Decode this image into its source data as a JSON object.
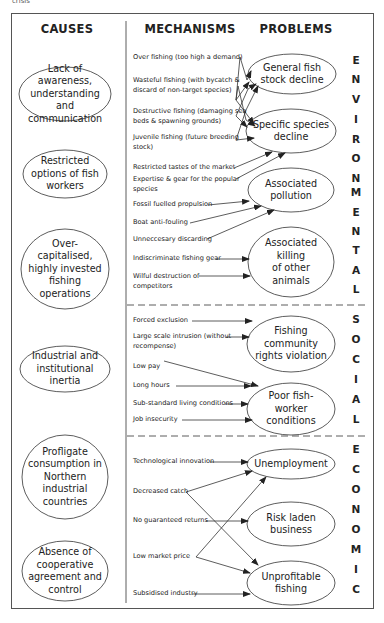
{
  "clipped_top_text": "crisis",
  "headers": {
    "causes": "CAUSES",
    "mechanisms": "MECHANISMS",
    "problems": "PROBLEMS"
  },
  "causes": [
    {
      "label": "Lack of awareness, understanding and communication"
    },
    {
      "label": "Restricted options of fish workers"
    },
    {
      "label": "Over-capitalised, highly invested fishing operations"
    },
    {
      "label": "Industrial and institutional inertia"
    },
    {
      "label": "Profligate consumption in Northern industrial countries"
    },
    {
      "label": "Absence of cooperative agreement and control"
    }
  ],
  "sections": [
    {
      "name": "ENVIRONMENTAL",
      "letters": [
        "E",
        "N",
        "V",
        "I",
        "R",
        "O",
        "N",
        "M",
        "E",
        "N",
        "T",
        "A",
        "L"
      ],
      "mechanisms": [
        {
          "l1": "Over fishing (too high a demand)",
          "l2": ""
        },
        {
          "l1": "Wasteful fishing (with bycatch &",
          "l2": "discard of non-target species)"
        },
        {
          "l1": "Destructive fishing (damaging sea",
          "l2": "beds & spawning grounds)"
        },
        {
          "l1": "Juvenile fishing (future breeding",
          "l2": "stock)"
        },
        {
          "l1": "Restricted tastes of the market",
          "l2": ""
        },
        {
          "l1": "Expertise & gear for the popular",
          "l2": "species"
        },
        {
          "l1": "Fossil fuelled propulsion",
          "l2": ""
        },
        {
          "l1": "Boat anti-fouling",
          "l2": ""
        },
        {
          "l1": "Unneccesary discarding",
          "l2": ""
        },
        {
          "l1": "Indiscriminate fishing gear",
          "l2": ""
        },
        {
          "l1": "Wilful destruction of",
          "l2": "competitors"
        }
      ],
      "problems": [
        {
          "l1": "General fish",
          "l2": "stock decline"
        },
        {
          "l1": "Specific species",
          "l2": "decline"
        },
        {
          "l1": "Associated",
          "l2": "pollution"
        },
        {
          "l1": "Associated",
          "l2": "killing",
          "l3": "of other",
          "l4": "animals"
        }
      ]
    },
    {
      "name": "SOCIAL",
      "letters": [
        "S",
        "O",
        "C",
        "I",
        "A",
        "L"
      ],
      "mechanisms": [
        {
          "l1": "Forced exclusion",
          "l2": ""
        },
        {
          "l1": "Large scale intrusion (without",
          "l2": "recompense)"
        },
        {
          "l1": "Low pay",
          "l2": ""
        },
        {
          "l1": "Long hours",
          "l2": ""
        },
        {
          "l1": "Sub-standard living conditions",
          "l2": ""
        },
        {
          "l1": "Job insecurity",
          "l2": ""
        }
      ],
      "problems": [
        {
          "l1": "Fishing",
          "l2": "community",
          "l3": "rights violation"
        },
        {
          "l1": "Poor fish-",
          "l2": "worker",
          "l3": "conditions"
        }
      ]
    },
    {
      "name": "ECONOMIC",
      "letters": [
        "E",
        "C",
        "O",
        "N",
        "O",
        "M",
        "I",
        "C"
      ],
      "mechanisms": [
        {
          "l1": "Technological innovation",
          "l2": ""
        },
        {
          "l1": "Decreased catch",
          "l2": ""
        },
        {
          "l1": "No guaranteed returns",
          "l2": ""
        },
        {
          "l1": "Low market price",
          "l2": ""
        },
        {
          "l1": "Subsidised industry",
          "l2": ""
        }
      ],
      "problems": [
        {
          "l1": "Unemployment"
        },
        {
          "l1": "Risk laden",
          "l2": "business"
        },
        {
          "l1": "Unprofitable",
          "l2": "fishing"
        }
      ]
    }
  ],
  "colors": {
    "line": "#333333",
    "frame": "#555555",
    "text": "#222222"
  }
}
